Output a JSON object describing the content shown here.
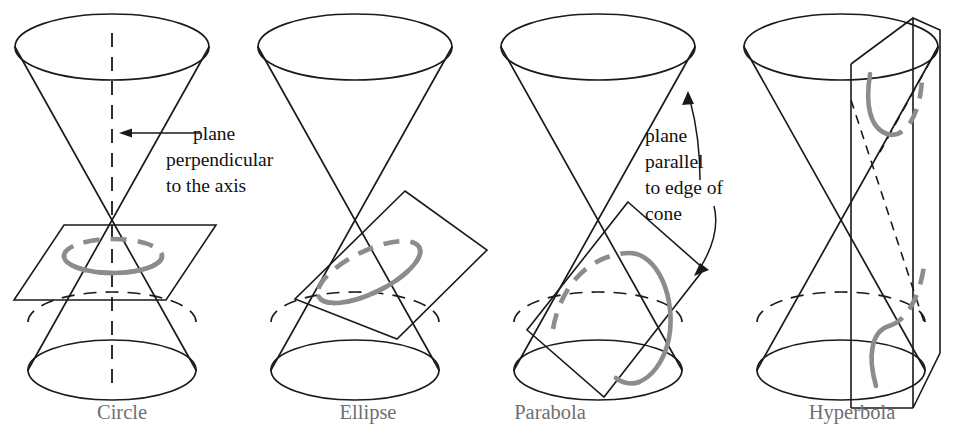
{
  "figure": {
    "background_color": "#ffffff",
    "line_color": "#1a1a1a",
    "conic_curve_color": "#8c8c8c",
    "caption_color": "#6f6f6f",
    "annotation_color": "#111111"
  },
  "annotations": [
    {
      "id": "perpendicular-note",
      "lines": [
        "plane",
        "perpendicular",
        "to the axis"
      ],
      "arrow": "straight-arrow-pointing-left"
    },
    {
      "id": "parallel-note",
      "lines": [
        "plane",
        "parallel",
        "to edge of",
        "cone"
      ],
      "arrow": "curved-arrows-pointing-to-plane-and-cone-edge"
    }
  ],
  "panels": [
    {
      "id": "circle",
      "caption": "Circle",
      "cutting_plane": "horizontal plane perpendicular to the cone axis",
      "conic": "circle",
      "shows_axis": true
    },
    {
      "id": "ellipse",
      "caption": "Ellipse",
      "cutting_plane": "oblique plane cutting one nappe completely",
      "conic": "ellipse",
      "shows_axis": false
    },
    {
      "id": "parabola",
      "caption": "Parabola",
      "cutting_plane": "plane parallel to an edge (generator) of the cone",
      "conic": "parabola",
      "shows_axis": false
    },
    {
      "id": "hyperbola",
      "caption": "Hyperbola",
      "cutting_plane": "vertical plane cutting both nappes",
      "conic": "hyperbola",
      "shows_axis": false
    }
  ]
}
